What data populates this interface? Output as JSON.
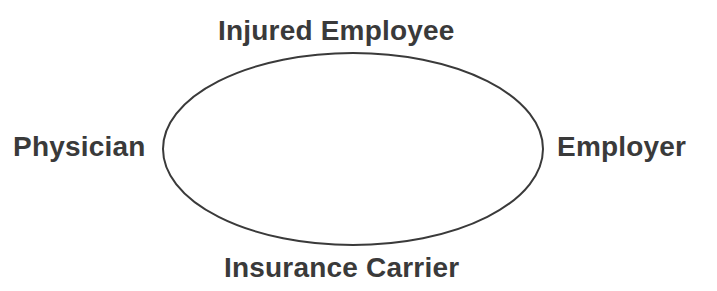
{
  "diagram": {
    "type": "relationship-cycle",
    "shape": "ellipse",
    "colors": {
      "stroke": "#3a3a3a",
      "text": "#3a3a3a",
      "background": "#ffffff"
    },
    "nodes": {
      "top": "Injured Employee",
      "right": "Employer",
      "bottom": "Insurance Carrier",
      "left": "Physician"
    }
  }
}
